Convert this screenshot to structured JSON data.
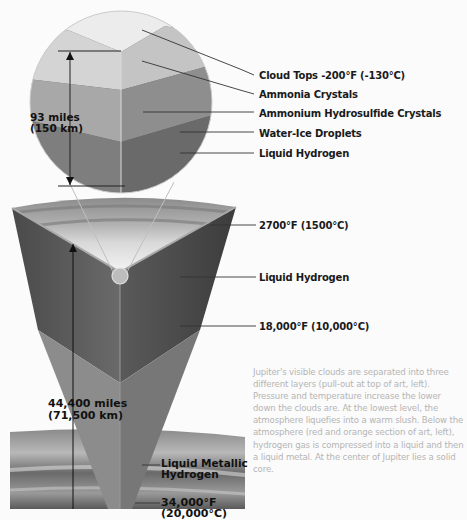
{
  "pullout": {
    "dimension": {
      "line1": "93 miles",
      "line2": "(150 km)"
    },
    "labels": [
      "Cloud Tops -200°F (-130°C)",
      "Ammonia Crystals",
      "Ammonium Hydrosulfide Crystals",
      "Water-Ice Droplets",
      "Liquid Hydrogen"
    ]
  },
  "cutaway": {
    "dimension": {
      "line1": "44,400 miles",
      "line2": "(71,500 km)"
    },
    "labels": [
      "2700°F (1500°C)",
      "Liquid Hydrogen",
      "18,000°F (10,000°C)"
    ],
    "inner_labels": {
      "metallic_line1": "Liquid Metallic",
      "metallic_line2": "Hydrogen",
      "core_temp_line1": "34,000°F",
      "core_temp_line2": "(20,000°C)"
    }
  },
  "caption": "Jupiter's visible clouds are separated into three different layers (pull-out at top of art, left). Pressure and temperature increase the lower down the clouds are. At the lowest level, the atmosphere liquefies into a warm slush. Below the atmosphere (red and orange section of art, left), hydrogen gas is compressed into a liquid and then a liquid metal. At the center of Jupiter lies a solid core."
}
